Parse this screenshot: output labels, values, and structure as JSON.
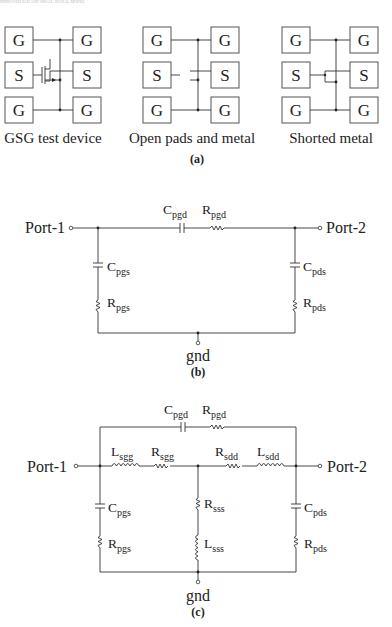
{
  "header": {
    "text": "IMPROVED PAD AND SMALL-SIGNAL MODEL"
  },
  "panel_a": {
    "devices": [
      {
        "pads": [
          "G",
          "G",
          "S",
          "S",
          "G",
          "G"
        ],
        "caption": "GSG test device"
      },
      {
        "pads": [
          "G",
          "G",
          "S",
          "S",
          "G",
          "G"
        ],
        "caption": "Open pads and metal"
      },
      {
        "pads": [
          "G",
          "G",
          "S",
          "S",
          "G",
          "G"
        ],
        "caption": "Shorted metal"
      }
    ],
    "label": "(a)"
  },
  "panel_b": {
    "port1": "Port-1",
    "port2": "Port-2",
    "gnd": "gnd",
    "components": {
      "cpgd": {
        "main": "C",
        "sub": "pgd"
      },
      "rpgd": {
        "main": "R",
        "sub": "pgd"
      },
      "cpgs": {
        "main": "C",
        "sub": "pgs"
      },
      "rpgs": {
        "main": "R",
        "sub": "pgs"
      },
      "cpds": {
        "main": "C",
        "sub": "pds"
      },
      "rpds": {
        "main": "R",
        "sub": "pds"
      }
    },
    "label": "(b)"
  },
  "panel_c": {
    "port1": "Port-1",
    "port2": "Port-2",
    "gnd": "gnd",
    "components": {
      "cpgd": {
        "main": "C",
        "sub": "pgd"
      },
      "rpgd": {
        "main": "R",
        "sub": "pgd"
      },
      "lsgg": {
        "main": "L",
        "sub": "sgg"
      },
      "rsgg": {
        "main": "R",
        "sub": "sgg"
      },
      "rsdd": {
        "main": "R",
        "sub": "sdd"
      },
      "lsdd": {
        "main": "L",
        "sub": "sdd"
      },
      "cpgs": {
        "main": "C",
        "sub": "pgs"
      },
      "rpgs": {
        "main": "R",
        "sub": "pgs"
      },
      "rsss": {
        "main": "R",
        "sub": "sss"
      },
      "lsss": {
        "main": "L",
        "sub": "sss"
      },
      "cpds": {
        "main": "C",
        "sub": "pds"
      },
      "rpds": {
        "main": "R",
        "sub": "pds"
      }
    },
    "label": "(c)"
  }
}
